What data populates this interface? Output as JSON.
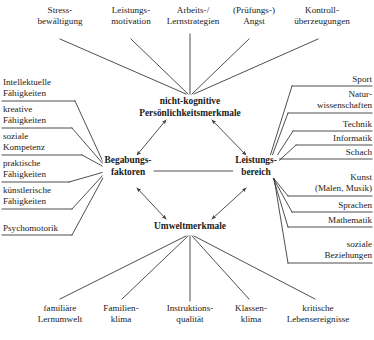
{
  "diagram": {
    "core_nodes": [
      {
        "id": "begabungsfaktoren",
        "lines": [
          "Begabungs-",
          "faktoren"
        ]
      },
      {
        "id": "nicht-kognitive",
        "lines": [
          "nicht-kognitive",
          "Persönlichkeitsmerkmale"
        ]
      },
      {
        "id": "umweltmerkmale",
        "lines": [
          "Umweltmerkmale"
        ]
      },
      {
        "id": "leistungsbereich",
        "lines": [
          "Leistungs-",
          "bereich"
        ]
      }
    ],
    "top_items": [
      {
        "lines": [
          "Stress-",
          "bewältigung"
        ]
      },
      {
        "lines": [
          "Leistungs-",
          "motivation"
        ]
      },
      {
        "lines": [
          "Arbeits-/",
          "Lernstrategien"
        ]
      },
      {
        "lines": [
          "(Prüfungs-)",
          "Angst"
        ]
      },
      {
        "lines": [
          "Kontroll-",
          "überzeugungen"
        ]
      }
    ],
    "left_items": [
      {
        "lines": [
          "Intellektuelle",
          "Fähigkeiten"
        ]
      },
      {
        "lines": [
          "kreative",
          "Fähigkeiten"
        ]
      },
      {
        "lines": [
          "soziale",
          "Kompetenz"
        ]
      },
      {
        "lines": [
          "praktische",
          "Fähigkeiten"
        ]
      },
      {
        "lines": [
          "künstlerische",
          "Fähigkeiten"
        ]
      },
      {
        "lines": [
          "Psychomotorik"
        ]
      }
    ],
    "right_items": [
      {
        "lines": [
          "Sport"
        ]
      },
      {
        "lines": [
          "Natur-",
          "wissenschaften"
        ]
      },
      {
        "lines": [
          "Technik"
        ]
      },
      {
        "lines": [
          "Informatik"
        ]
      },
      {
        "lines": [
          "Schach"
        ]
      },
      {
        "lines": [
          "Kunst",
          "(Malen, Musik)"
        ]
      },
      {
        "lines": [
          "Sprachen"
        ]
      },
      {
        "lines": [
          "Mathematik"
        ]
      },
      {
        "lines": [
          "soziale",
          "Beziehungen"
        ]
      }
    ],
    "bottom_items": [
      {
        "lines": [
          "familiäre",
          "Lernumwelt"
        ]
      },
      {
        "lines": [
          "Familien-",
          "klima"
        ]
      },
      {
        "lines": [
          "Instruktions-",
          "qualität"
        ]
      },
      {
        "lines": [
          "Klassen-",
          "klima"
        ]
      },
      {
        "lines": [
          "kritische",
          "Lebensereignisse"
        ]
      }
    ],
    "colors": {
      "line": "#3b3b3b",
      "text": "#1a1a1a",
      "background": "#ffffff"
    }
  }
}
